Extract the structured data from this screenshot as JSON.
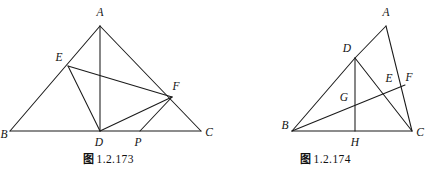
{
  "page": {
    "background_color": "#ffffff",
    "ink_color": "#1a1a1a",
    "width": 434,
    "height": 176
  },
  "figures": [
    {
      "id": "figure-left",
      "caption_cjk": "图",
      "caption_number": "1.2.173",
      "caption_full": "图 1.2.173",
      "description": "Triangle ABC with cevian AD, points E on AB, F on AC, P on BC; segments ED, EF, DF, FP drawn.",
      "points": [
        {
          "name": "A",
          "x": 100,
          "y": 26,
          "label_x": 100,
          "label_y": 13
        },
        {
          "name": "B",
          "x": 10,
          "y": 131,
          "label_x": 4,
          "label_y": 135
        },
        {
          "name": "C",
          "x": 201,
          "y": 131,
          "label_x": 209,
          "label_y": 133
        },
        {
          "name": "D",
          "x": 100,
          "y": 131,
          "label_x": 99,
          "label_y": 143
        },
        {
          "name": "E",
          "x": 68,
          "y": 66,
          "label_x": 59,
          "label_y": 58
        },
        {
          "name": "F",
          "x": 172,
          "y": 97,
          "label_x": 176,
          "label_y": 87
        },
        {
          "name": "P",
          "x": 140,
          "y": 131,
          "label_x": 138,
          "label_y": 143
        }
      ],
      "segments": [
        {
          "from": "B",
          "to": "C",
          "name": "segment-bc"
        },
        {
          "from": "B",
          "to": "A",
          "name": "segment-ba"
        },
        {
          "from": "A",
          "to": "C",
          "name": "segment-ac"
        },
        {
          "from": "A",
          "to": "D",
          "name": "segment-ad"
        },
        {
          "from": "E",
          "to": "D",
          "name": "segment-ed"
        },
        {
          "from": "E",
          "to": "F",
          "name": "segment-ef"
        },
        {
          "from": "D",
          "to": "F",
          "name": "segment-df"
        },
        {
          "from": "F",
          "to": "P",
          "name": "segment-fp"
        }
      ]
    },
    {
      "id": "figure-right",
      "caption_cjk": "图",
      "caption_number": "1.2.174",
      "caption_full": "图 1.2.174",
      "description": "Triangle ABC with D on AB, H foot on BC, F on AC, E intersection on DC, G intersection on BF; segments BD, DH, DC, BF drawn.",
      "points": [
        {
          "name": "A",
          "x": 386,
          "y": 26,
          "label_x": 386,
          "label_y": 13
        },
        {
          "name": "B",
          "x": 292,
          "y": 131,
          "label_x": 285,
          "label_y": 126
        },
        {
          "name": "C",
          "x": 412,
          "y": 131,
          "label_x": 420,
          "label_y": 133
        },
        {
          "name": "D",
          "x": 355,
          "y": 58,
          "label_x": 347,
          "label_y": 49
        },
        {
          "name": "E",
          "x": 391,
          "y": 86,
          "label_x": 389,
          "label_y": 79
        },
        {
          "name": "F",
          "x": 405,
          "y": 85,
          "label_x": 409,
          "label_y": 78
        },
        {
          "name": "G",
          "x": 352,
          "y": 103,
          "label_x": 344,
          "label_y": 98
        },
        {
          "name": "H",
          "x": 355,
          "y": 131,
          "label_x": 355,
          "label_y": 143
        }
      ],
      "segments": [
        {
          "from": "B",
          "to": "C",
          "name": "segment-bc"
        },
        {
          "from": "B",
          "to": "D",
          "name": "segment-bd"
        },
        {
          "from": "D",
          "to": "A",
          "name": "segment-da"
        },
        {
          "from": "A",
          "to": "C",
          "name": "segment-ac"
        },
        {
          "from": "D",
          "to": "H",
          "name": "segment-dh"
        },
        {
          "from": "D",
          "to": "C",
          "name": "segment-dc"
        },
        {
          "from": "B",
          "to": "F",
          "name": "segment-bf"
        }
      ]
    }
  ]
}
